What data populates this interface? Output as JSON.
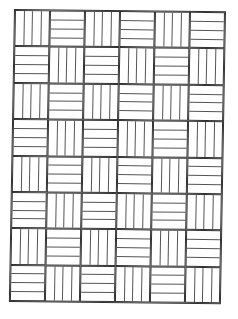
{
  "pattern": {
    "name": "basketweave",
    "columns": 6,
    "rows": 8,
    "strips_per_cell": 4,
    "line_color": "#333333",
    "background": "#ffffff",
    "first_cell_orientation": "vertical",
    "orientation_rule": "alternating checkerboard"
  }
}
